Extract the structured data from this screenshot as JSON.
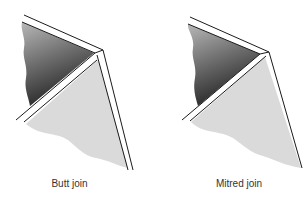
{
  "figures": [
    {
      "id": "butt",
      "caption": "Butt join",
      "description": "Two boards meeting at a corner where one board overlaps the end of the other"
    },
    {
      "id": "mitre",
      "caption": "Mitred join",
      "description": "Two boards meeting at a corner with ends cut at an angle so they meet on a diagonal"
    }
  ],
  "colors": {
    "background": "#ffffff",
    "dark_panel_top": "#b4b4b4",
    "dark_panel_bottom": "#2a2a2a",
    "light_panel": "#dadada",
    "edge_stroke": "#1a1a1a",
    "caption_text": "#333333"
  }
}
